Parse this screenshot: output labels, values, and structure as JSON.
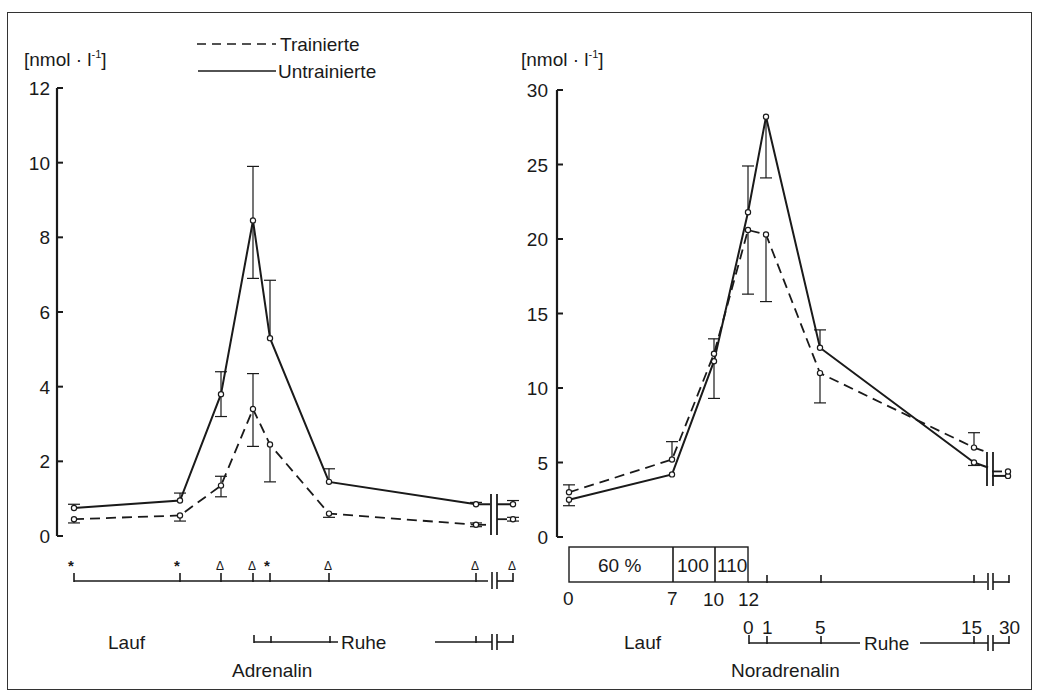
{
  "legend": {
    "items": [
      {
        "label": "Trainierte",
        "style": "dashed"
      },
      {
        "label": "Untrainierte",
        "style": "solid"
      }
    ]
  },
  "chart_data": [
    {
      "type": "line",
      "title": "Adrenalin",
      "ylabel": "[nmol · l⁻¹]",
      "ylim": [
        0,
        12
      ],
      "yticks": [
        0,
        2,
        4,
        6,
        8,
        10,
        12
      ],
      "x_phase_labels": {
        "run": "Lauf",
        "rest": "Ruhe"
      },
      "x_markers": [
        "*",
        "*",
        "Δ",
        "Δ",
        "*",
        "Δ",
        "Δ",
        "Δ"
      ],
      "x_points": [
        "Lauf 0",
        "Lauf 7",
        "Lauf 10",
        "Lauf 12 / Ruhe 0",
        "Ruhe 1",
        "Ruhe 5",
        "Ruhe 15",
        "Ruhe 30"
      ],
      "series": [
        {
          "name": "Untrainierte",
          "style": "solid",
          "values": [
            0.75,
            0.95,
            3.8,
            8.45,
            5.3,
            1.45,
            0.85,
            0.85
          ],
          "err_hi": [
            0.85,
            1.15,
            4.4,
            9.9,
            6.85,
            1.8,
            0.9,
            0.95
          ],
          "err_lo": [
            0.75,
            0.95,
            3.2,
            6.9,
            5.3,
            1.45,
            0.85,
            0.85
          ]
        },
        {
          "name": "Trainierte",
          "style": "dashed",
          "values": [
            0.45,
            0.55,
            1.35,
            3.4,
            2.45,
            0.6,
            0.3,
            0.45
          ],
          "err_hi": [
            0.45,
            0.55,
            1.6,
            4.35,
            2.45,
            0.6,
            0.35,
            0.5
          ],
          "err_lo": [
            0.35,
            0.4,
            1.05,
            2.4,
            1.45,
            0.5,
            0.25,
            0.4
          ]
        }
      ]
    },
    {
      "type": "line",
      "title": "Noradrenalin",
      "ylabel": "[nmol · l⁻¹]",
      "ylim": [
        0,
        30
      ],
      "yticks": [
        0,
        5,
        10,
        15,
        20,
        25,
        30
      ],
      "x_phase_labels": {
        "run": "Lauf",
        "rest": "Ruhe"
      },
      "run_ticks": [
        "0",
        "7",
        "10",
        "12"
      ],
      "rest_ticks": [
        "0",
        "1",
        "5",
        "15",
        "30"
      ],
      "intensity_blocks": [
        "60 %",
        "100",
        "110"
      ],
      "x_points": [
        "Lauf 0",
        "Lauf 7",
        "Lauf 10",
        "Lauf 12 / Ruhe 0",
        "Ruhe 1",
        "Ruhe 5",
        "Ruhe 15",
        "Ruhe 30"
      ],
      "series": [
        {
          "name": "Untrainierte",
          "style": "solid",
          "values": [
            2.5,
            4.2,
            11.8,
            21.8,
            28.2,
            12.7,
            5.0,
            4.1
          ],
          "err_hi": [
            2.5,
            4.2,
            11.8,
            24.9,
            28.2,
            13.9,
            5.0,
            4.1
          ],
          "err_lo": [
            2.1,
            4.2,
            9.3,
            21.8,
            24.1,
            12.7,
            4.8,
            4.1
          ]
        },
        {
          "name": "Trainierte",
          "style": "dashed",
          "values": [
            3.0,
            5.2,
            12.3,
            20.6,
            20.3,
            11.0,
            6.0,
            4.4
          ],
          "err_hi": [
            3.5,
            6.4,
            13.3,
            20.6,
            20.3,
            11.0,
            7.0,
            4.4
          ],
          "err_lo": [
            3.0,
            5.2,
            12.3,
            16.3,
            15.8,
            9.0,
            6.0,
            4.4
          ]
        }
      ]
    }
  ],
  "labels": {
    "left": {
      "unit": "[nmol · l",
      "unit_sup": "-1",
      "unit_close": "]",
      "run": "Lauf",
      "rest": "Ruhe",
      "hormone": "Adrenalin"
    },
    "right": {
      "unit": "[nmol · l",
      "unit_sup": "-1",
      "unit_close": "]",
      "run": "Lauf",
      "rest": "Ruhe",
      "hormone": "Noradrenalin",
      "block1": "60 %",
      "block2": "100",
      "block3": "110",
      "t0": "0",
      "t7": "7",
      "t10": "10",
      "t12": "12",
      "r0": "0",
      "r1": "1",
      "r5": "5",
      "r15": "15",
      "r30": "30"
    },
    "left_yticks": [
      "0",
      "2",
      "4",
      "6",
      "8",
      "10",
      "12"
    ],
    "right_yticks": [
      "0",
      "5",
      "10",
      "15",
      "20",
      "25",
      "30"
    ]
  }
}
